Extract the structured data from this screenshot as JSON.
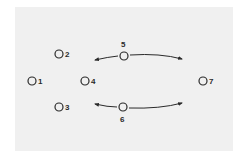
{
  "diagram": {
    "background": "#f0f0f0",
    "stroke_color": "#2a2a2a",
    "nodes": [
      {
        "id": "1",
        "label": "1",
        "x": 32,
        "y": 81
      },
      {
        "id": "2",
        "label": "2",
        "x": 59,
        "y": 54
      },
      {
        "id": "3",
        "label": "3",
        "x": 59,
        "y": 107
      },
      {
        "id": "4",
        "label": "4",
        "x": 85,
        "y": 81
      },
      {
        "id": "5",
        "label": "5",
        "x": 124,
        "y": 56
      },
      {
        "id": "6",
        "label": "6",
        "x": 123,
        "y": 107
      },
      {
        "id": "7",
        "label": "7",
        "x": 203,
        "y": 81
      }
    ],
    "arrows": [
      {
        "from": "5",
        "direction": "left"
      },
      {
        "from": "5",
        "direction": "right"
      },
      {
        "from": "6",
        "direction": "left"
      },
      {
        "from": "6",
        "direction": "right"
      }
    ]
  }
}
